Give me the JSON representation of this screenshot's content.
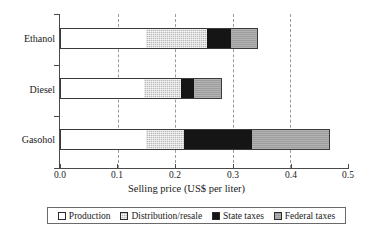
{
  "chart_data": {
    "type": "bar",
    "orientation": "horizontal",
    "stacked": true,
    "title": "",
    "xlabel": "Selling price (US$ per liter)",
    "ylabel": "",
    "xlim": [
      0.0,
      0.5
    ],
    "grid": true,
    "grid_axis": "x",
    "legend_position": "bottom",
    "categories": [
      "Ethanol",
      "Diesel",
      "Gasohol"
    ],
    "xticks": [
      0.0,
      0.1,
      0.2,
      0.3,
      0.4,
      0.5
    ],
    "xtick_labels": [
      "0.0",
      "0.1",
      "0.2",
      "0.3",
      "0.4",
      "0.5"
    ],
    "series": [
      {
        "name": "Production",
        "color": "#ffffff",
        "values": [
          0.15,
          0.145,
          0.15
        ]
      },
      {
        "name": "Distribution/resale",
        "color": "#b9b9b9",
        "values": [
          0.105,
          0.065,
          0.065
        ]
      },
      {
        "name": "State taxes",
        "color": "#151515",
        "values": [
          0.042,
          0.023,
          0.118
        ]
      },
      {
        "name": "Federal taxes",
        "color": "#9d9d9d",
        "values": [
          0.047,
          0.048,
          0.136
        ]
      }
    ],
    "totals": [
      0.344,
      0.281,
      0.469
    ]
  },
  "axis": {
    "x_title": "Selling price (US$ per liter)",
    "tick_0": "0.0",
    "tick_1": "0.1",
    "tick_2": "0.2",
    "tick_3": "0.3",
    "tick_4": "0.4",
    "tick_5": "0.5"
  },
  "categories": {
    "ethanol": "Ethanol",
    "diesel": "Diesel",
    "gasohol": "Gasohol"
  },
  "legend": {
    "items": [
      {
        "label": "Production"
      },
      {
        "label": "Distribution/resale"
      },
      {
        "label": "State taxes"
      },
      {
        "label": "Federal taxes"
      }
    ]
  }
}
